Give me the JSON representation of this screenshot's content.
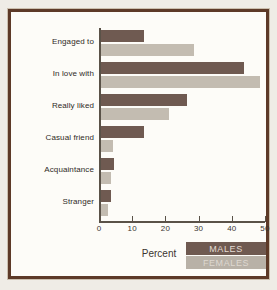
{
  "figure": {
    "axis_title": "Percent",
    "legend": [
      {
        "label": "MALES",
        "color": "#6f5a51"
      },
      {
        "label": "FEMALES",
        "color": "#c3bcb1"
      }
    ]
  },
  "chart_data": {
    "type": "bar",
    "orientation": "horizontal",
    "title": "",
    "xlabel": "Percent",
    "ylabel": "",
    "xlim": [
      0,
      50
    ],
    "xticks": [
      0,
      10,
      20,
      30,
      40,
      50
    ],
    "grid": false,
    "legend_position": "bottom-right",
    "categories": [
      "Engaged to",
      "In love with",
      "Really liked",
      "Casual friend",
      "Acquaintance",
      "Stranger"
    ],
    "series": [
      {
        "name": "MALES",
        "color": "#6f5a51",
        "values": [
          13,
          43,
          26,
          13,
          4,
          3
        ]
      },
      {
        "name": "FEMALES",
        "color": "#c3bcb1",
        "values": [
          28,
          48,
          20.5,
          3.5,
          3,
          2
        ]
      }
    ]
  }
}
